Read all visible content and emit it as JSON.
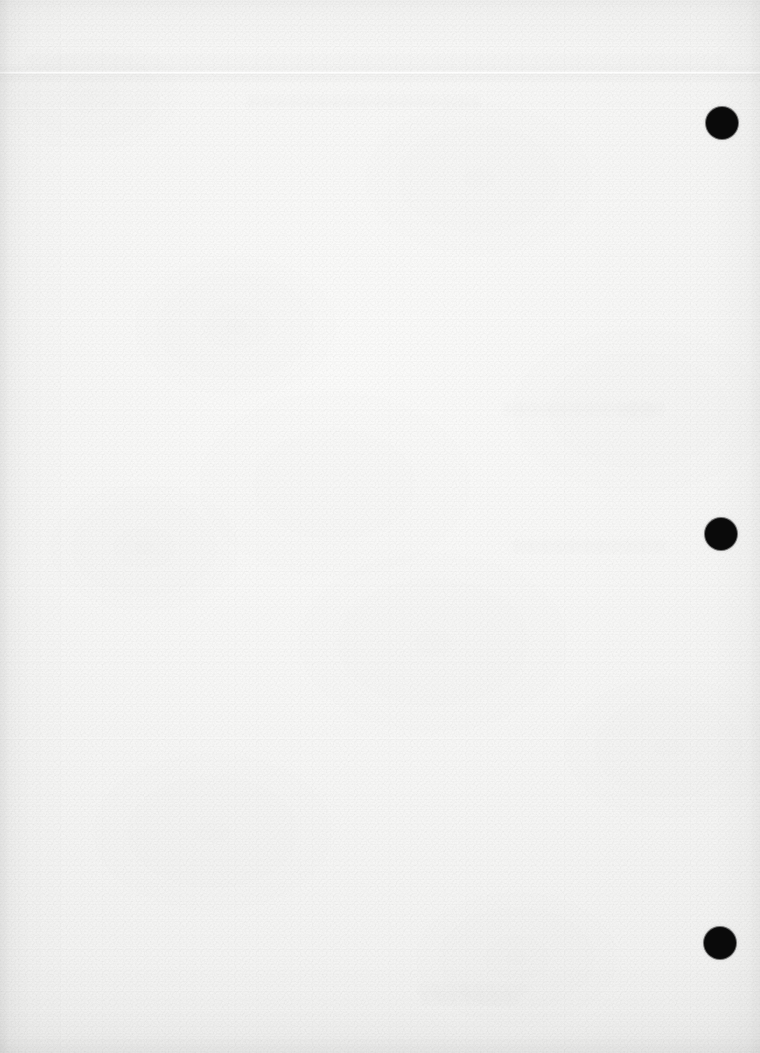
{
  "document": {
    "kind": "scanned-blank-page",
    "description": "Photographed or scanned sheet of blank white paper with visible paper grain",
    "width_px": 760,
    "height_px": 1053,
    "orientation": "portrait",
    "legible_text_present": false
  },
  "colors": {
    "paper_light": "#fbfbfa",
    "paper_mid": "#f4f4f3",
    "paper_edge": "#ebebea",
    "punch_hole": "#0a0a0a",
    "ghost_text": "#606268",
    "page_backdrop": "#ffffff"
  },
  "punch_holes": [
    {
      "id": "hole-top",
      "label": "top punch hole",
      "cx": 722,
      "cy": 123,
      "diameter": 32
    },
    {
      "id": "hole-middle",
      "label": "middle punch hole",
      "cx": 721,
      "cy": 534,
      "diameter": 32
    },
    {
      "id": "hole-bottom",
      "label": "bottom punch hole",
      "cx": 720,
      "cy": 943,
      "diameter": 32
    }
  ],
  "creases": [
    {
      "id": "crease-top",
      "label": "horizontal fold crease",
      "y": 72,
      "orientation": "horizontal"
    }
  ],
  "ghost_regions": [
    {
      "id": "ghost-top-band",
      "label": "illegible show-through near top edge",
      "x": 30,
      "y": 55,
      "width": 700,
      "height": 14,
      "legible": false,
      "text": ""
    },
    {
      "id": "ghost-upper-mid",
      "label": "illegible show-through upper middle",
      "x": 250,
      "y": 96,
      "width": 230,
      "height": 12,
      "legible": false,
      "text": ""
    },
    {
      "id": "ghost-right-upper",
      "label": "illegible show-through right upper",
      "x": 505,
      "y": 403,
      "width": 160,
      "height": 12,
      "legible": false,
      "text": ""
    },
    {
      "id": "ghost-right-mid",
      "label": "illegible show-through right middle",
      "x": 515,
      "y": 540,
      "width": 150,
      "height": 12,
      "legible": false,
      "text": ""
    },
    {
      "id": "ghost-bottom-line-1",
      "label": "illegible show-through bottom line one",
      "x": 420,
      "y": 984,
      "width": 112,
      "height": 11,
      "legible": false,
      "text": ""
    },
    {
      "id": "ghost-bottom-line-2",
      "label": "illegible show-through bottom line two",
      "x": 424,
      "y": 993,
      "width": 96,
      "height": 11,
      "legible": false,
      "text": ""
    }
  ]
}
